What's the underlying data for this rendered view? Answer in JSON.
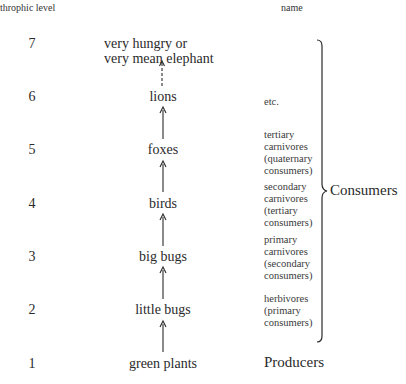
{
  "headers": {
    "level": "throphic level",
    "name": "name"
  },
  "levels": [
    {
      "level": "7",
      "organism": "very hungry or very mean elephant",
      "organism_lines": [
        "very hungry or",
        "very mean elephant"
      ],
      "name_lines": []
    },
    {
      "level": "6",
      "organism": "lions",
      "name_lines": [
        "etc."
      ]
    },
    {
      "level": "5",
      "organism": "foxes",
      "name_lines": [
        "tertiary",
        "carnivores",
        "(quaternary",
        "consumers)"
      ]
    },
    {
      "level": "4",
      "organism": "birds",
      "name_lines": [
        "secondary",
        "carnivores",
        "(tertiary",
        "consumers)"
      ]
    },
    {
      "level": "3",
      "organism": "big bugs",
      "name_lines": [
        "primary",
        "carnivores",
        "(secondary",
        "consumers)"
      ]
    },
    {
      "level": "2",
      "organism": "little bugs",
      "name_lines": [
        "herbivores",
        "(primary",
        "consumers)"
      ]
    },
    {
      "level": "1",
      "organism": "green plants",
      "name_lines": [
        "Producers"
      ]
    }
  ],
  "group_label": "Consumers",
  "arrows": [
    {
      "from": "green plants",
      "to": "little bugs",
      "style": "solid"
    },
    {
      "from": "little bugs",
      "to": "big bugs",
      "style": "solid"
    },
    {
      "from": "big bugs",
      "to": "birds",
      "style": "solid"
    },
    {
      "from": "birds",
      "to": "foxes",
      "style": "solid"
    },
    {
      "from": "foxes",
      "to": "lions",
      "style": "solid"
    },
    {
      "from": "lions",
      "to": "very hungry or very mean elephant",
      "style": "dashed"
    }
  ]
}
